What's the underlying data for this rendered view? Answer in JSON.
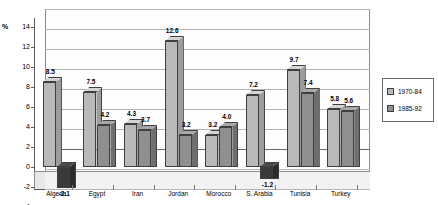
{
  "chart_data": {
    "type": "bar",
    "title": "",
    "subtitle": "",
    "xlabel": "",
    "ylabel": "%",
    "ylim": [
      -4,
      14
    ],
    "ytick_step": 2,
    "grid": true,
    "legend_position": "right",
    "categories": [
      "Algeria",
      "Egypt",
      "Iran",
      "Jordan",
      "Morocco",
      "S. Arabia",
      "Tunisia",
      "Turkey"
    ],
    "ytick_labels": [
      "14",
      "12",
      "10",
      "8",
      "6",
      "4",
      "2",
      "0",
      "-2",
      "-4"
    ],
    "series": [
      {
        "name": "1970-84",
        "color": "#b9b9b9",
        "values": [
          8.5,
          7.5,
          4.3,
          12.6,
          3.2,
          7.2,
          9.7,
          5.8
        ],
        "labels": [
          "8.5",
          "7.5",
          "4.3",
          "12.6",
          "3.2",
          "7.2",
          "9.7",
          "5.8"
        ]
      },
      {
        "name": "1985-92",
        "color": "#8f8f8f",
        "values": [
          -2.1,
          4.2,
          3.7,
          3.2,
          4.0,
          -1.2,
          7.4,
          5.6
        ],
        "labels": [
          "-2.1",
          "4.2",
          "3.7",
          "3.2",
          "4.0",
          "-1.2",
          "7.4",
          "5.6"
        ]
      }
    ]
  },
  "legend": {
    "items": [
      {
        "label": "1970-84"
      },
      {
        "label": "1985-92"
      }
    ]
  },
  "axis": {
    "unit_label": "%"
  }
}
